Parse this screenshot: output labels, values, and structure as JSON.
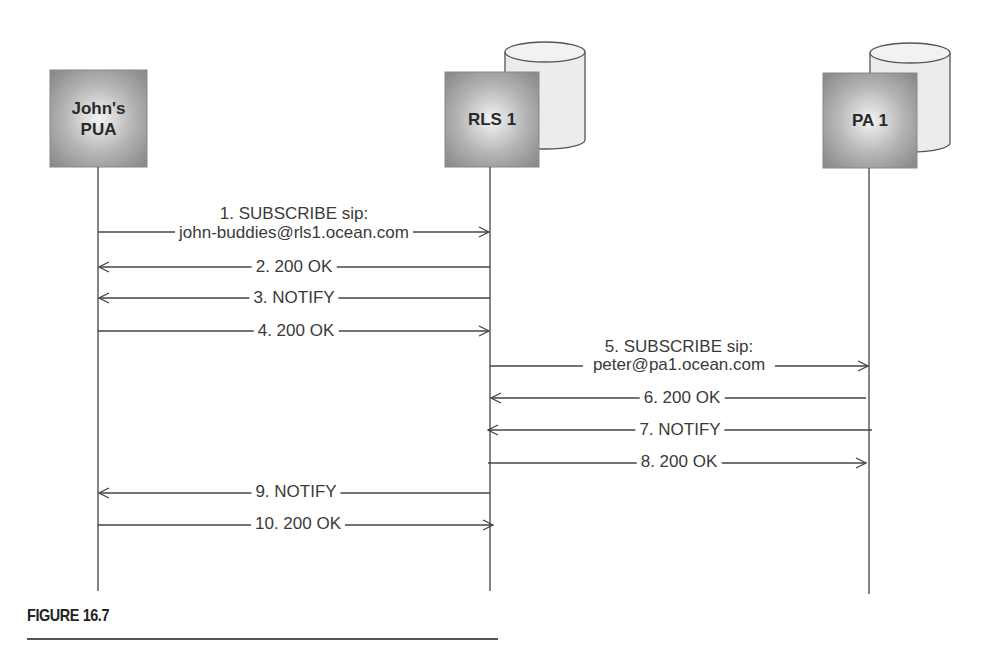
{
  "entities": [
    {
      "id": "pua",
      "label_line1": "John's",
      "label_line2": "PUA",
      "has_database": false
    },
    {
      "id": "rls",
      "label_line1": "RLS 1",
      "label_line2": "",
      "has_database": true
    },
    {
      "id": "pa",
      "label_line1": "PA 1",
      "label_line2": "",
      "has_database": true
    }
  ],
  "messages": [
    {
      "n": 1,
      "line1": "1. SUBSCRIBE sip:",
      "line2": "john-buddies@rls1.ocean.com",
      "from": "pua",
      "to": "rls"
    },
    {
      "n": 2,
      "line1": "2. 200 OK",
      "from": "rls",
      "to": "pua"
    },
    {
      "n": 3,
      "line1": "3. NOTIFY",
      "from": "rls",
      "to": "pua"
    },
    {
      "n": 4,
      "line1": "4. 200 OK",
      "from": "pua",
      "to": "rls"
    },
    {
      "n": 5,
      "line1": "5. SUBSCRIBE sip:",
      "line2": "peter@pa1.ocean.com",
      "from": "rls",
      "to": "pa"
    },
    {
      "n": 6,
      "line1": "6. 200 OK",
      "from": "pa",
      "to": "rls"
    },
    {
      "n": 7,
      "line1": "7. NOTIFY",
      "from": "pa",
      "to": "rls"
    },
    {
      "n": 8,
      "line1": "8. 200 OK",
      "from": "rls",
      "to": "pa"
    },
    {
      "n": 9,
      "line1": "9. NOTIFY",
      "from": "rls",
      "to": "pua"
    },
    {
      "n": 10,
      "line1": "10. 200 OK",
      "from": "pua",
      "to": "rls"
    }
  ],
  "caption": "FIGURE 16.7"
}
